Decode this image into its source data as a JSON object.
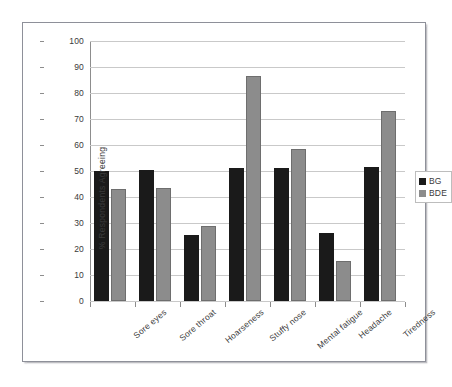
{
  "chart_data": {
    "type": "bar",
    "title": "",
    "xlabel": "",
    "ylabel": "% Respondents Agreeing",
    "ylim": [
      0,
      100
    ],
    "yticks": [
      0,
      10,
      20,
      30,
      40,
      50,
      60,
      70,
      80,
      90,
      100
    ],
    "grid": true,
    "legend_position": "right",
    "categories": [
      "Sore eyes",
      "Sore throat",
      "Hoarseness",
      "Stuffy nose",
      "Mental fatigue",
      "Headache",
      "Tiredness"
    ],
    "series": [
      {
        "name": "BG",
        "color": "#1a1a1a",
        "values": [
          50,
          50.5,
          25.5,
          51,
          51,
          26,
          51.5
        ]
      },
      {
        "name": "BDE",
        "color": "#8c8c8c",
        "values": [
          43,
          43.5,
          29,
          86.5,
          58.5,
          15.5,
          73
        ]
      }
    ]
  },
  "legend": {
    "items": [
      {
        "label": "BG"
      },
      {
        "label": "BDE"
      }
    ]
  },
  "axis": {
    "y_title": "% Respondents Agreeing",
    "tick_labels": [
      "100",
      "90",
      "80",
      "70",
      "60",
      "50",
      "40",
      "30",
      "20",
      "10",
      "0"
    ]
  }
}
